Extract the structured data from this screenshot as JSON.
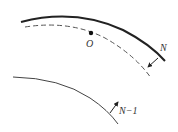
{
  "diagram": {
    "labels": {
      "point": "O",
      "upper_arrow": "N",
      "lower_arrow": "N−1"
    },
    "colors": {
      "stroke": "#333333",
      "dashed": "#555555",
      "background": "#ffffff"
    },
    "elements": [
      {
        "type": "solid-curve-thick",
        "description": "upper boundary curve"
      },
      {
        "type": "dashed-curve",
        "description": "midline curve passing through point O"
      },
      {
        "type": "point",
        "label": "O"
      },
      {
        "type": "arrow",
        "label": "N",
        "description": "normal arrow between upper curve and dashed curve"
      },
      {
        "type": "solid-curve-thin",
        "description": "lower curve"
      },
      {
        "type": "arrow",
        "label": "N−1",
        "description": "normal arrow on lower curve"
      }
    ]
  }
}
